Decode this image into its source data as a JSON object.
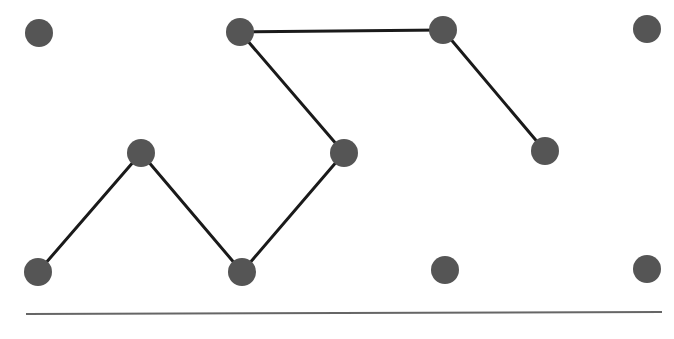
{
  "diagram": {
    "type": "graph",
    "node_color": "#555555",
    "edge_color": "#1a1a1a",
    "baseline_color": "#666666",
    "node_radius": 14,
    "nodes": [
      {
        "id": "n1",
        "x": 39,
        "y": 33
      },
      {
        "id": "n2",
        "x": 240,
        "y": 32
      },
      {
        "id": "n3",
        "x": 443,
        "y": 30
      },
      {
        "id": "n4",
        "x": 647,
        "y": 29
      },
      {
        "id": "n5",
        "x": 141,
        "y": 153
      },
      {
        "id": "n6",
        "x": 344,
        "y": 153
      },
      {
        "id": "n7",
        "x": 545,
        "y": 151
      },
      {
        "id": "n8",
        "x": 38,
        "y": 272
      },
      {
        "id": "n9",
        "x": 242,
        "y": 272
      },
      {
        "id": "n10",
        "x": 445,
        "y": 270
      },
      {
        "id": "n11",
        "x": 647,
        "y": 269
      }
    ],
    "edges": [
      {
        "from": "n8",
        "to": "n5"
      },
      {
        "from": "n5",
        "to": "n9"
      },
      {
        "from": "n9",
        "to": "n6"
      },
      {
        "from": "n6",
        "to": "n2"
      },
      {
        "from": "n2",
        "to": "n3"
      },
      {
        "from": "n3",
        "to": "n7"
      }
    ],
    "baseline": {
      "x1": 26,
      "y1": 314,
      "x2": 662,
      "y2": 312
    }
  }
}
